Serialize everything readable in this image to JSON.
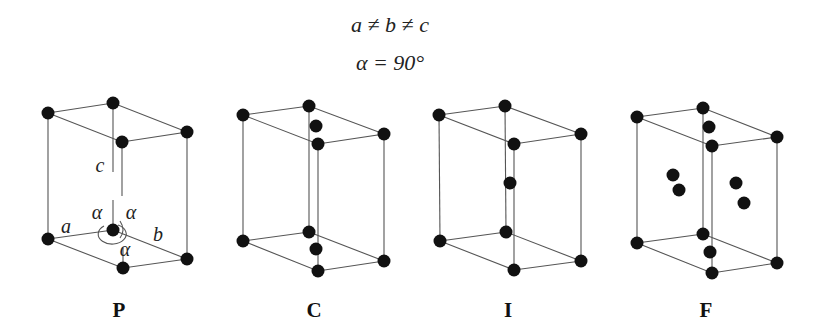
{
  "header": {
    "equation_lengths": "a ≠ b ≠ c",
    "equation_angles": "α = 90°"
  },
  "panels": [
    {
      "label": "P",
      "name": "primitive",
      "atoms": [
        [
          48,
          113
        ],
        [
          113,
          103
        ],
        [
          187,
          132
        ],
        [
          122,
          142
        ],
        [
          48,
          239
        ],
        [
          113,
          230
        ],
        [
          123,
          268
        ],
        [
          187,
          259
        ]
      ],
      "axis_labels": {
        "a": "a",
        "b": "b",
        "c": "c",
        "alpha": "α"
      }
    },
    {
      "label": "C",
      "name": "base-centered",
      "atoms": [
        [
          243,
          115
        ],
        [
          309,
          106
        ],
        [
          384,
          134
        ],
        [
          318,
          144
        ],
        [
          243,
          241
        ],
        [
          309,
          232
        ],
        [
          318,
          271
        ],
        [
          384,
          261
        ],
        [
          316,
          126
        ],
        [
          316,
          249
        ]
      ]
    },
    {
      "label": "I",
      "name": "body-centered",
      "atoms": [
        [
          439,
          115
        ],
        [
          505,
          106
        ],
        [
          581,
          134
        ],
        [
          514,
          144
        ],
        [
          440,
          241
        ],
        [
          506,
          232
        ],
        [
          514,
          270
        ],
        [
          581,
          261
        ],
        [
          510,
          183
        ]
      ]
    },
    {
      "label": "F",
      "name": "face-centered",
      "atoms": [
        [
          637,
          117
        ],
        [
          703,
          108
        ],
        [
          777,
          137
        ],
        [
          712,
          146
        ],
        [
          637,
          243
        ],
        [
          703,
          234
        ],
        [
          712,
          273
        ],
        [
          777,
          263
        ],
        [
          709,
          127
        ],
        [
          710,
          252
        ],
        [
          673,
          175
        ],
        [
          679,
          190
        ],
        [
          736,
          183
        ],
        [
          744,
          203
        ]
      ]
    }
  ],
  "colors": {
    "atom": "#111111",
    "edge": "#555555",
    "background": "#ffffff"
  }
}
